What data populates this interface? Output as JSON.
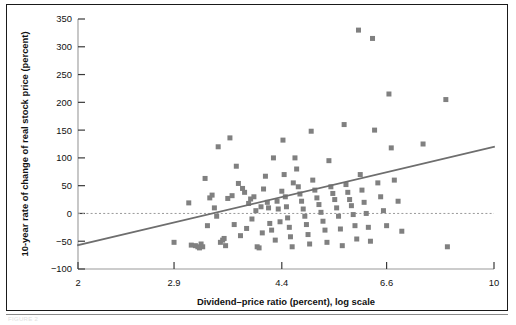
{
  "figure": {
    "caption_ghost": "FIGURE 2"
  },
  "chart_data": {
    "type": "scatter",
    "title": "",
    "xlabel": "Dividend–price ratio (percent), log scale",
    "ylabel": "10-year rate of change of real stock price (percent)",
    "xscale": "log",
    "xlim": [
      2,
      10
    ],
    "ylim": [
      -100,
      350
    ],
    "xticks": [
      2,
      2.9,
      4.4,
      6.6,
      10
    ],
    "xticklabels": [
      "2",
      "2.9",
      "4.4",
      "6.6",
      "10"
    ],
    "yticks": [
      -100,
      -50,
      0,
      50,
      100,
      150,
      200,
      250,
      300,
      350
    ],
    "yticklabels": [
      "−100",
      "−50",
      "0",
      "50",
      "100",
      "150",
      "200",
      "250",
      "300",
      "350"
    ],
    "grid": false,
    "legend": null,
    "marker": {
      "shape": "square",
      "color": "#808080",
      "size_px": 5
    },
    "reference_line": {
      "name": "zero-line",
      "y": 0,
      "style": "dashed",
      "color": "#9a9a9a"
    },
    "trend_line": {
      "name": "regression-line",
      "style": "solid",
      "color": "#6e6e6e",
      "x_start": 2,
      "y_start": -57,
      "x_end": 10,
      "y_end": 120
    },
    "points": [
      [
        2.9,
        -52
      ],
      [
        3.07,
        19
      ],
      [
        3.1,
        -57
      ],
      [
        3.15,
        -58
      ],
      [
        3.18,
        -60
      ],
      [
        3.2,
        -62
      ],
      [
        3.22,
        -55
      ],
      [
        3.24,
        -60
      ],
      [
        3.27,
        63
      ],
      [
        3.3,
        -22
      ],
      [
        3.33,
        28
      ],
      [
        3.36,
        33
      ],
      [
        3.39,
        10
      ],
      [
        3.42,
        -5
      ],
      [
        3.44,
        120
      ],
      [
        3.47,
        -52
      ],
      [
        3.5,
        -48
      ],
      [
        3.52,
        -45
      ],
      [
        3.54,
        -58
      ],
      [
        3.57,
        27
      ],
      [
        3.6,
        136
      ],
      [
        3.63,
        32
      ],
      [
        3.66,
        -20
      ],
      [
        3.69,
        85
      ],
      [
        3.72,
        54
      ],
      [
        3.75,
        -40
      ],
      [
        3.78,
        45
      ],
      [
        3.81,
        38
      ],
      [
        3.84,
        -27
      ],
      [
        3.87,
        18
      ],
      [
        3.9,
        26
      ],
      [
        3.92,
        -10
      ],
      [
        3.95,
        30
      ],
      [
        3.98,
        5
      ],
      [
        4.0,
        -60
      ],
      [
        4.03,
        -62
      ],
      [
        4.06,
        12
      ],
      [
        4.08,
        -35
      ],
      [
        4.1,
        44
      ],
      [
        4.13,
        67
      ],
      [
        4.16,
        20
      ],
      [
        4.18,
        10
      ],
      [
        4.2,
        -18
      ],
      [
        4.23,
        -30
      ],
      [
        4.26,
        100
      ],
      [
        4.29,
        -48
      ],
      [
        4.32,
        22
      ],
      [
        4.34,
        8
      ],
      [
        4.37,
        -15
      ],
      [
        4.4,
        40
      ],
      [
        4.42,
        132
      ],
      [
        4.44,
        70
      ],
      [
        4.46,
        30
      ],
      [
        4.48,
        12
      ],
      [
        4.5,
        -8
      ],
      [
        4.53,
        -25
      ],
      [
        4.55,
        -42
      ],
      [
        4.58,
        -60
      ],
      [
        4.6,
        55
      ],
      [
        4.63,
        100
      ],
      [
        4.66,
        80
      ],
      [
        4.69,
        48
      ],
      [
        4.72,
        35
      ],
      [
        4.75,
        22
      ],
      [
        4.78,
        8
      ],
      [
        4.81,
        -5
      ],
      [
        4.84,
        -20
      ],
      [
        4.87,
        -38
      ],
      [
        4.9,
        -55
      ],
      [
        4.93,
        148
      ],
      [
        4.96,
        60
      ],
      [
        5.0,
        42
      ],
      [
        5.04,
        28
      ],
      [
        5.08,
        16
      ],
      [
        5.12,
        2
      ],
      [
        5.16,
        -14
      ],
      [
        5.2,
        -30
      ],
      [
        5.24,
        -52
      ],
      [
        5.28,
        95
      ],
      [
        5.32,
        48
      ],
      [
        5.36,
        36
      ],
      [
        5.4,
        25
      ],
      [
        5.44,
        10
      ],
      [
        5.48,
        -5
      ],
      [
        5.52,
        -28
      ],
      [
        5.56,
        -58
      ],
      [
        5.6,
        160
      ],
      [
        5.64,
        52
      ],
      [
        5.68,
        38
      ],
      [
        5.72,
        25
      ],
      [
        5.76,
        14
      ],
      [
        5.8,
        -2
      ],
      [
        5.84,
        -22
      ],
      [
        5.88,
        -46
      ],
      [
        5.92,
        330
      ],
      [
        5.96,
        70
      ],
      [
        6.0,
        42
      ],
      [
        6.05,
        20
      ],
      [
        6.1,
        0
      ],
      [
        6.15,
        -25
      ],
      [
        6.2,
        -50
      ],
      [
        6.25,
        315
      ],
      [
        6.3,
        150
      ],
      [
        6.38,
        55
      ],
      [
        6.45,
        30
      ],
      [
        6.52,
        5
      ],
      [
        6.6,
        -22
      ],
      [
        6.66,
        215
      ],
      [
        6.72,
        118
      ],
      [
        6.8,
        60
      ],
      [
        6.9,
        22
      ],
      [
        7.0,
        -32
      ],
      [
        7.6,
        125
      ],
      [
        8.3,
        205
      ],
      [
        8.35,
        -60
      ]
    ]
  }
}
